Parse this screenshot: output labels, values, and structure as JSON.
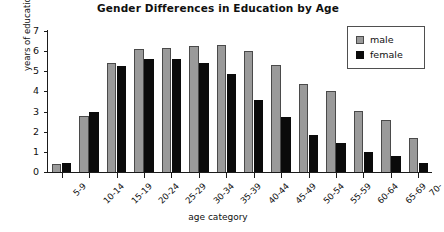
{
  "chart_data": {
    "type": "bar",
    "title": "Gender Differences in Education by Age",
    "xlabel": "age category",
    "ylabel": "years of education",
    "ylim": [
      0,
      7
    ],
    "yticks": [
      0,
      1,
      2,
      3,
      4,
      5,
      6,
      7
    ],
    "grid": false,
    "legend_position": "top-right",
    "categories": [
      "5-9",
      "10-14",
      "15-19",
      "20-24",
      "25-29",
      "30-34",
      "35-39",
      "40-44",
      "45-49",
      "50-54",
      "55-59",
      "60-64",
      "65-69",
      "70-"
    ],
    "series": [
      {
        "name": "male",
        "color": "#9a9a9a",
        "values": [
          0.4,
          2.8,
          5.4,
          6.1,
          6.15,
          6.25,
          6.3,
          6.0,
          5.3,
          4.35,
          4.0,
          3.05,
          2.6,
          1.7
        ]
      },
      {
        "name": "female",
        "color": "#0b0b0b",
        "values": [
          0.45,
          3.0,
          5.25,
          5.6,
          5.6,
          5.4,
          4.85,
          3.6,
          2.75,
          1.85,
          1.45,
          1.0,
          0.8,
          0.45
        ]
      }
    ]
  }
}
